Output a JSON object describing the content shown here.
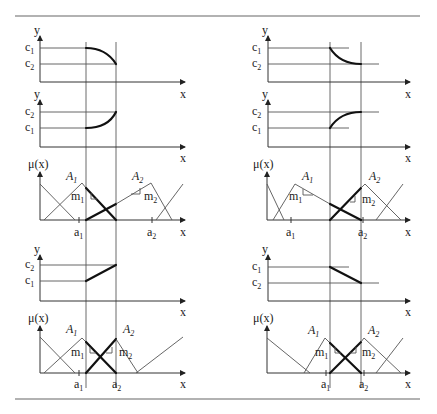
{
  "figure": {
    "labels": {
      "y": "y",
      "x": "x",
      "mu": "μ(x)",
      "c": "c",
      "a": "a",
      "A": "A",
      "m": "m",
      "sub1": "1",
      "sub2": "2"
    },
    "left_column": {
      "panels": [
        {
          "type": "output",
          "curve": "concave-down decreasing",
          "levels_top_to_bottom": [
            "c1",
            "c2"
          ]
        },
        {
          "type": "output",
          "curve": "convex increasing",
          "levels_top_to_bottom": [
            "c2",
            "c1"
          ]
        },
        {
          "type": "membership",
          "sets": [
            "A1",
            "A2"
          ],
          "slopes": [
            "m1",
            "m2"
          ],
          "ticks": [
            "a1",
            "a2"
          ]
        },
        {
          "type": "output",
          "curve": "linear increasing",
          "levels_top_to_bottom": [
            "c2",
            "c1"
          ]
        },
        {
          "type": "membership",
          "sets": [
            "A1",
            "A2"
          ],
          "slopes": [
            "m1",
            "m2"
          ],
          "ticks": [
            "a1",
            "a2"
          ]
        }
      ]
    },
    "right_column": {
      "panels": [
        {
          "type": "output",
          "curve": "convex decreasing",
          "levels_top_to_bottom": [
            "c1",
            "c2"
          ]
        },
        {
          "type": "output",
          "curve": "concave increasing",
          "levels_top_to_bottom": [
            "c2",
            "c1"
          ]
        },
        {
          "type": "membership",
          "sets": [
            "A1",
            "A2"
          ],
          "slopes": [
            "m1",
            "m2"
          ],
          "ticks": [
            "a1",
            "a2"
          ]
        },
        {
          "type": "output",
          "curve": "linear decreasing",
          "levels_top_to_bottom": [
            "c1",
            "c2"
          ]
        },
        {
          "type": "membership",
          "sets": [
            "A1",
            "A2"
          ],
          "slopes": [
            "m1",
            "m2"
          ],
          "ticks": [
            "a1",
            "a2"
          ]
        }
      ]
    }
  }
}
